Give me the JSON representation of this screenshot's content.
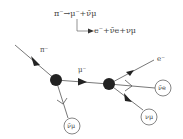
{
  "equations": {
    "line1": "π⁻→μ⁻+ν̄μ",
    "line2": "e⁻+ν̄e+νμ"
  },
  "particles": {
    "incoming": "π⁻",
    "intermediate": "μ⁻",
    "electron": "e⁻",
    "antineutrino_mu_first": "ν̄μ",
    "antineutrino_e": "ν̄e",
    "neutrino_mu": "νμ"
  },
  "colors": {
    "line": "#555555",
    "vertex": "#222222",
    "circle": "#666666"
  }
}
